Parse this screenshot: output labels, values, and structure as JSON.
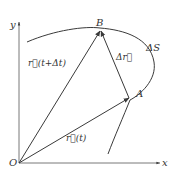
{
  "diagram": {
    "colors": {
      "line": "#3a3a3a",
      "text": "#333333",
      "background": "#ffffff"
    },
    "axes": {
      "x_label": "x",
      "y_label": "y",
      "origin_label": "O"
    },
    "points": {
      "A": {
        "label": "A"
      },
      "B": {
        "label": "B"
      }
    },
    "vectors": {
      "r_t": {
        "label": "r⃗(t)"
      },
      "r_t_dt": {
        "label": "r⃗(t+Δt)"
      },
      "delta_r": {
        "label": "Δr⃗"
      }
    },
    "arc": {
      "label": "ΔS"
    }
  }
}
